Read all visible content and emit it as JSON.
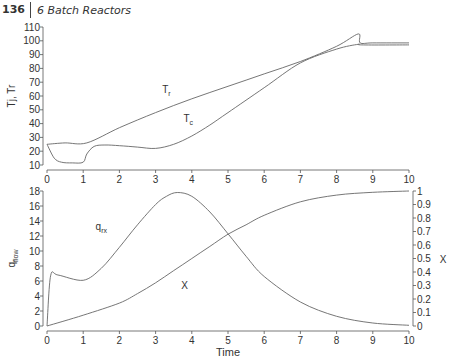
{
  "header": {
    "page_number": "136",
    "chapter_title": "6  Batch Reactors"
  },
  "chart_data": [
    {
      "type": "line",
      "title": "",
      "xlabel": "",
      "ylabel": "Tj, Tr",
      "xlim": [
        0,
        10
      ],
      "ylim": [
        10,
        110
      ],
      "xticks": [
        0,
        1,
        2,
        3,
        4,
        5,
        6,
        7,
        8,
        9,
        10
      ],
      "yticks": [
        10,
        20,
        30,
        40,
        50,
        60,
        70,
        80,
        90,
        100,
        110
      ],
      "grid": false,
      "series": [
        {
          "name": "Tr",
          "label": "T_r",
          "x": [
            0,
            0.5,
            1.1,
            2,
            3,
            4,
            5,
            6,
            7,
            8,
            8.6,
            8.65,
            9,
            10
          ],
          "y": [
            25,
            26,
            26,
            37,
            48,
            58,
            67,
            76,
            85,
            96,
            105,
            98.5,
            98.5,
            98.5
          ]
        },
        {
          "name": "Tc",
          "label": "T_c",
          "x": [
            0,
            0.2,
            0.4,
            0.7,
            1.0,
            1.1,
            1.3,
            1.6,
            2,
            2.5,
            3,
            3.5,
            4,
            4.5,
            5,
            6,
            7,
            8,
            8.6,
            8.7,
            10
          ],
          "y": [
            25,
            15,
            12,
            11.5,
            12,
            18,
            23.5,
            24.5,
            24,
            23,
            22,
            25,
            31,
            39,
            48,
            66,
            84,
            94,
            97.5,
            97,
            97
          ]
        }
      ],
      "annotations": [
        {
          "text": "T_r",
          "x": 3.3,
          "y": 62
        },
        {
          "text": "T_c",
          "x": 3.9,
          "y": 41
        }
      ]
    },
    {
      "type": "line",
      "title": "",
      "xlabel": "Time",
      "ylabel": "q_flow",
      "ylabel_right": "X",
      "xlim": [
        0,
        10
      ],
      "ylim": [
        0,
        18
      ],
      "ylim_right": [
        0,
        1
      ],
      "xticks": [
        0,
        1,
        2,
        3,
        4,
        5,
        6,
        7,
        8,
        9,
        10
      ],
      "yticks": [
        0,
        2,
        4,
        6,
        8,
        10,
        12,
        14,
        16,
        18
      ],
      "yticks_right": [
        0,
        0.1,
        0.2,
        0.3,
        0.4,
        0.5,
        0.6,
        0.7,
        0.8,
        0.9,
        1
      ],
      "grid": false,
      "series": [
        {
          "name": "qrx",
          "label": "q_rx",
          "axis": "left",
          "x": [
            0,
            0.1,
            0.3,
            1.0,
            1.5,
            2,
            2.5,
            3,
            3.3,
            3.6,
            4,
            4.5,
            5,
            5.5,
            6,
            7,
            8,
            9,
            10
          ],
          "y": [
            0,
            6.7,
            6.8,
            6.1,
            7.7,
            10.5,
            13.5,
            16.2,
            17.3,
            17.8,
            17.3,
            15.2,
            12.3,
            9.3,
            6.6,
            3.2,
            1.3,
            0.4,
            0.1
          ]
        },
        {
          "name": "X",
          "label": "X",
          "axis": "right",
          "x": [
            0,
            1,
            2,
            2.5,
            3,
            3.5,
            4,
            4.5,
            5,
            5.5,
            6,
            7,
            8,
            9,
            10
          ],
          "y": [
            0,
            0.08,
            0.17,
            0.24,
            0.32,
            0.41,
            0.5,
            0.59,
            0.68,
            0.75,
            0.82,
            0.92,
            0.97,
            0.99,
            1.0
          ]
        }
      ],
      "annotations": [
        {
          "text": "q_rx",
          "x": 1.5,
          "y": 12.8
        },
        {
          "text": "X",
          "x": 3.8,
          "y": 5
        }
      ]
    }
  ]
}
